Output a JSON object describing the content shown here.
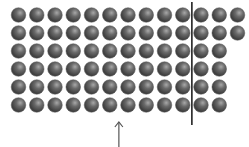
{
  "diagram": {
    "type": "dot-array",
    "rows": [
      13,
      13,
      12,
      12,
      12,
      12
    ],
    "total_dots": 74,
    "dot_color": "#4a4a4a",
    "dot_highlight": "#9a9a9a",
    "divider": {
      "after_column": 10,
      "color": "#222222"
    },
    "arrow": {
      "below_column": 6.5,
      "direction": "up",
      "color": "#555555"
    }
  },
  "layout": {
    "first_x": 18.5,
    "first_y": 15,
    "dx": 18.25,
    "dy": 18,
    "radius": 7.3
  }
}
